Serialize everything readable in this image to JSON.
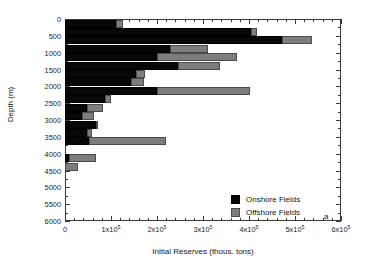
{
  "chart_data": {
    "type": "bar",
    "orientation": "horizontal",
    "stacked": true,
    "title": "",
    "xlabel": "Initial Reserves (thous. tons)",
    "ylabel": "Depth (m)",
    "xlim": [
      0,
      600000
    ],
    "ylim": [
      0,
      6000
    ],
    "xticks": [
      0,
      100000,
      200000,
      300000,
      400000,
      500000,
      600000
    ],
    "xtick_labels": [
      "0",
      "1x10^5",
      "2x10^5",
      "3x10^5",
      "4x10^5",
      "5x10^5",
      "6x10^5"
    ],
    "yticks": [
      0,
      500,
      1000,
      1500,
      2000,
      2500,
      3000,
      3500,
      4000,
      4500,
      5000,
      5500,
      6000
    ],
    "ytick_labels": [
      "0",
      "500",
      "1000",
      "1500",
      "2000",
      "2500",
      "3000",
      "3500",
      "4000",
      "4500",
      "5000",
      "5500",
      "6000"
    ],
    "x_minor_ticks_per_major": 5,
    "y_minor_ticks_per_major": 2,
    "grid": false,
    "panel_label": "a",
    "legend_position": "lower right",
    "categories": [
      0,
      250,
      500,
      750,
      1000,
      1250,
      1500,
      1750,
      2000,
      2250,
      2500,
      2750,
      3000,
      3250,
      3500,
      4000,
      4250
    ],
    "series": [
      {
        "name": "Onshore Fields",
        "color": "#080808",
        "values": [
          111000,
          404000,
          472000,
          228000,
          200000,
          246000,
          154000,
          143000,
          200000,
          87000,
          48000,
          37000,
          67000,
          48000,
          52000,
          9000,
          0
        ]
      },
      {
        "name": "Offshore Fields",
        "color": "#7d7d7d",
        "values": [
          15000,
          13000,
          65000,
          83000,
          174000,
          91000,
          20000,
          29000,
          202000,
          13000,
          35000,
          26000,
          5000,
          11000,
          168000,
          58000,
          28000
        ]
      }
    ]
  },
  "legend": {
    "items": [
      {
        "label": "Onshore Fields",
        "swatch": "onshore-swatch"
      },
      {
        "label": "Offshore Fields",
        "swatch": "offshore-swatch"
      }
    ]
  },
  "axes": {
    "x_title": "Initial Reserves (thous. tons)",
    "y_title": "Depth (m)"
  },
  "panel_label": "a"
}
